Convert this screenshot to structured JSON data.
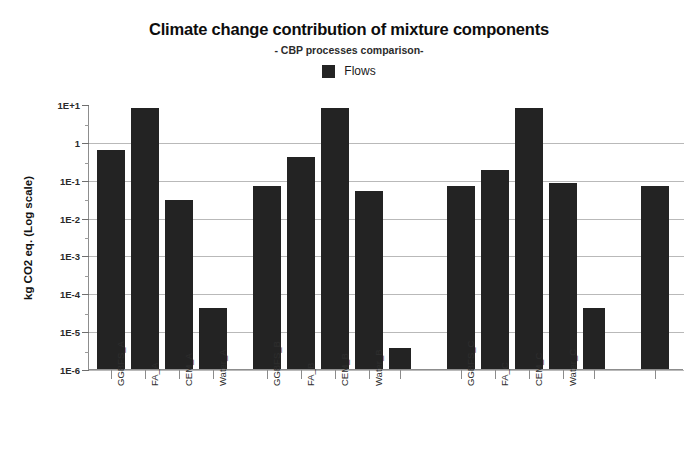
{
  "chart_data": {
    "type": "bar",
    "title": "Climate change contribution of mixture components",
    "subtitle": "- CBP processes comparison-",
    "xlabel": "",
    "ylabel": "kg CO2 eq. (Log scale)",
    "yscale": "log",
    "ylim": [
      1e-06,
      10
    ],
    "ytick_labels": [
      "1E+1",
      "1",
      "1E-1",
      "1E-2",
      "1E-3",
      "1E-4",
      "1E-5",
      "1E-6"
    ],
    "ytick_values": [
      10,
      1,
      0.1,
      0.01,
      0.001,
      0.0001,
      1e-05,
      1e-06
    ],
    "grid": true,
    "legend": [
      {
        "name": "Flows",
        "color": "#232323"
      }
    ],
    "legend_position": "top-center",
    "bar_color": "#232323",
    "categories": [
      "GGBFS_A",
      "FA_A",
      "CEM_A",
      "Water_A",
      "",
      "GGBFS_B",
      "FA_B",
      "CEM_B",
      "Water_B",
      "",
      "GGBFS_C",
      "FA_C",
      "CEM_C",
      "Water_C",
      "",
      ""
    ],
    "series": [
      {
        "name": "Flows",
        "values": [
          0.6,
          8.0,
          0.03,
          4e-05,
          null,
          0.07,
          0.4,
          8.0,
          0.05,
          3.5e-06,
          0.07,
          0.18,
          8.0,
          0.08,
          4e-05,
          0.07
        ]
      }
    ],
    "bars": [
      {
        "label": "GGBFS_A",
        "value": 0.6,
        "x": 96,
        "width": 28,
        "tick": 110,
        "labeled": true
      },
      {
        "label": "FA_A",
        "value": 8.0,
        "x": 130,
        "width": 28,
        "tick": 144,
        "labeled": true
      },
      {
        "label": "CEM_A",
        "value": 0.03,
        "x": 164,
        "width": 28,
        "tick": 178,
        "labeled": true
      },
      {
        "label": "Water_A",
        "value": 4e-05,
        "x": 198,
        "width": 28,
        "tick": 212,
        "labeled": true
      },
      {
        "label": "GGBFS_B",
        "value": 0.07,
        "x": 252,
        "width": 28,
        "tick": 266,
        "labeled": true
      },
      {
        "label": "FA_B",
        "value": 0.4,
        "x": 286,
        "width": 28,
        "tick": 300,
        "labeled": true
      },
      {
        "label": "CEM_B",
        "value": 8.0,
        "x": 320,
        "width": 28,
        "tick": 334,
        "labeled": true
      },
      {
        "label": "Water_B",
        "value": 0.05,
        "x": 354,
        "width": 28,
        "tick": 368,
        "labeled": true
      },
      {
        "label": "",
        "value": 3.5e-06,
        "x": 388,
        "width": 22,
        "tick": 399,
        "labeled": false
      },
      {
        "label": "GGBFS_C",
        "value": 0.07,
        "x": 446,
        "width": 28,
        "tick": 460,
        "labeled": true
      },
      {
        "label": "FA_C",
        "value": 0.18,
        "x": 480,
        "width": 28,
        "tick": 494,
        "labeled": true
      },
      {
        "label": "CEM_C",
        "value": 8.0,
        "x": 514,
        "width": 28,
        "tick": 528,
        "labeled": true
      },
      {
        "label": "Water_C",
        "value": 0.08,
        "x": 548,
        "width": 28,
        "tick": 562,
        "labeled": true
      },
      {
        "label": "",
        "value": 4e-05,
        "x": 582,
        "width": 22,
        "tick": 593,
        "labeled": false
      },
      {
        "label": "",
        "value": 0.07,
        "x": 640,
        "width": 28,
        "tick": 654,
        "labeled": false
      }
    ]
  }
}
